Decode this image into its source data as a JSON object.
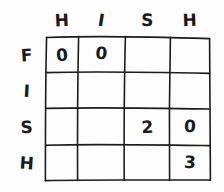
{
  "diagram": {
    "kind": "hand-drawn-matrix",
    "title": "",
    "ink_color": "#1a1a1a",
    "paper_color": "#fdfdfd",
    "column_header_label": "HISH",
    "row_header_label": "FISH",
    "column_headers": [
      "H",
      "I",
      "S",
      "H"
    ],
    "row_headers": [
      "F",
      "I",
      "S",
      "H"
    ],
    "grid": {
      "rows": 4,
      "cols": 4,
      "cells": [
        [
          "0",
          "0",
          "",
          ""
        ],
        [
          "",
          "",
          "",
          ""
        ],
        [
          "",
          "",
          "2",
          "0"
        ],
        [
          "",
          "",
          "",
          "3"
        ]
      ]
    }
  }
}
